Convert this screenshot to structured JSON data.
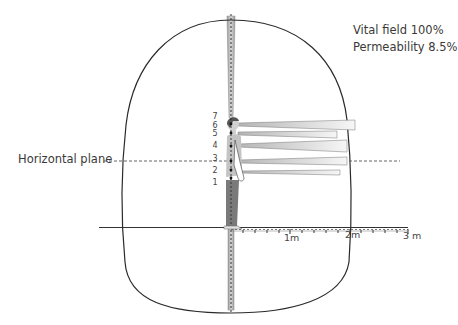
{
  "info": {
    "vital_field": "Vital field 100%",
    "permeability": "Permeability 8.5%"
  },
  "horizontal_plane": {
    "label": "Horizontal plane"
  },
  "scale": {
    "ticks": [
      {
        "label": "1m"
      },
      {
        "label": "2m"
      },
      {
        "label": "3 m"
      }
    ]
  },
  "levels": [
    {
      "label": "1"
    },
    {
      "label": "2"
    },
    {
      "label": "3"
    },
    {
      "label": "4"
    },
    {
      "label": "5"
    },
    {
      "label": "6"
    },
    {
      "label": "7"
    }
  ],
  "colors": {
    "outline": "#2a2a2a",
    "bar_fill_start": "#bdbdbd",
    "bar_fill_end": "#f4f4f4",
    "figure_body": "#bfbfbf",
    "figure_legs": "#7a7a7a",
    "axis": "#555555"
  }
}
